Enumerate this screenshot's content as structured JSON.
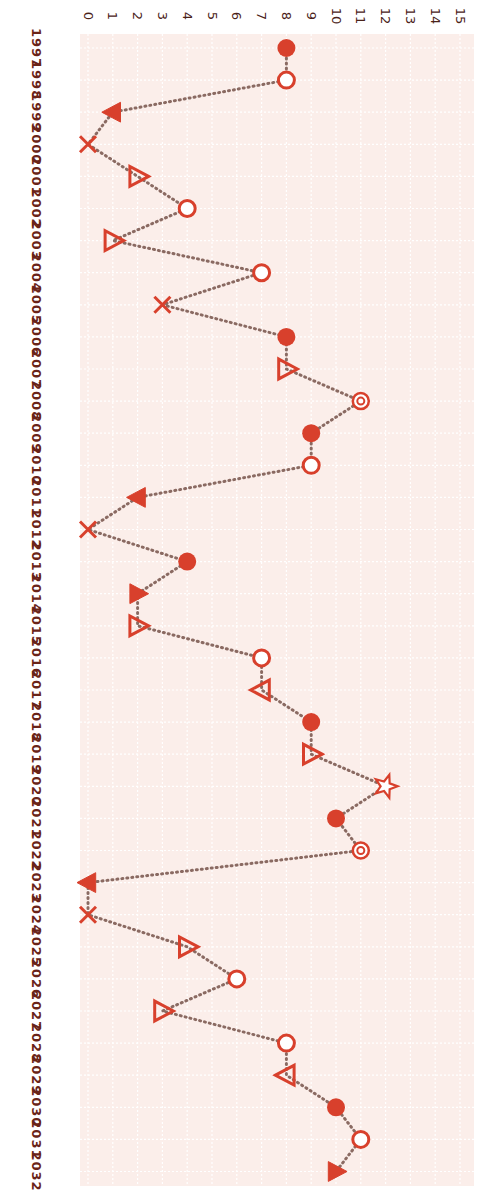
{
  "chart_data": {
    "type": "line",
    "orientation": "rotated-90-clockwise",
    "title": "",
    "xlabel": "",
    "ylabel": "",
    "x": [
      1997,
      1998,
      1999,
      2000,
      2001,
      2002,
      2003,
      2004,
      2005,
      2006,
      2007,
      2008,
      2009,
      2010,
      2011,
      2012,
      2013,
      2014,
      2015,
      2016,
      2017,
      2018,
      2019,
      2020,
      2021,
      2022,
      2023,
      2024,
      2025,
      2026,
      2027,
      2028,
      2029,
      2030,
      2031,
      2032
    ],
    "values": [
      8,
      8,
      1,
      0,
      2,
      4,
      1,
      7,
      3,
      8,
      8,
      11,
      9,
      9,
      2,
      0,
      4,
      2,
      2,
      7,
      7,
      9,
      9,
      12,
      10,
      11,
      0,
      0,
      4,
      6,
      3,
      8,
      8,
      10,
      11,
      10
    ],
    "markers": [
      "filled-circle",
      "open-circle",
      "filled-triangle-left",
      "x",
      "open-triangle-right",
      "open-circle",
      "open-triangle-right",
      "open-circle",
      "x",
      "filled-circle",
      "open-triangle-right",
      "target",
      "filled-circle",
      "open-circle",
      "filled-triangle-left",
      "x",
      "filled-circle",
      "filled-triangle-right",
      "open-triangle-right",
      "open-circle",
      "open-triangle-left",
      "filled-circle",
      "open-triangle-right",
      "open-star",
      "filled-circle",
      "target",
      "filled-triangle-left",
      "x",
      "open-triangle-right",
      "open-circle",
      "open-triangle-right",
      "open-circle",
      "open-triangle-left",
      "filled-circle",
      "open-circle",
      "filled-triangle-right"
    ],
    "value_ticks": [
      0,
      1,
      2,
      3,
      4,
      5,
      6,
      7,
      8,
      9,
      10,
      11,
      12,
      13,
      14,
      15
    ],
    "ylim": [
      0,
      15
    ],
    "grid": true,
    "line_style": "dotted",
    "legend": null
  },
  "colors": {
    "marker": "#d8402c",
    "line": "#8a6a62",
    "plot_bg": "#fbeeea",
    "grid": "#ffffff",
    "tick_label": "#4a2218",
    "year_label": "#6a2418"
  }
}
